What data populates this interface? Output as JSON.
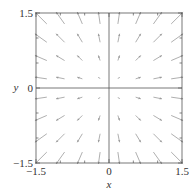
{
  "chart_data": {
    "type": "vector_field",
    "title": "",
    "xlabel": "x",
    "ylabel": "y",
    "xlim": [
      -1.5,
      1.5
    ],
    "ylim": [
      -1.5,
      1.5
    ],
    "xticks": [
      -1.5,
      0,
      1.5
    ],
    "yticks": [
      -1.5,
      0,
      1.5
    ],
    "xtick_labels": [
      "−1.5",
      "0",
      "1.5"
    ],
    "ytick_labels": [
      "−1.5",
      "0",
      "1.5"
    ],
    "grid": false,
    "field": "F(x, y) = (x, y) radial outward",
    "sample_points": [
      -1.4,
      -1.0,
      -0.6,
      -0.2,
      0.2,
      0.6,
      1.0,
      1.4
    ],
    "axis_lines_through_origin": true,
    "arrow_color": "#9a9a9a",
    "frame_color": "#555555"
  }
}
